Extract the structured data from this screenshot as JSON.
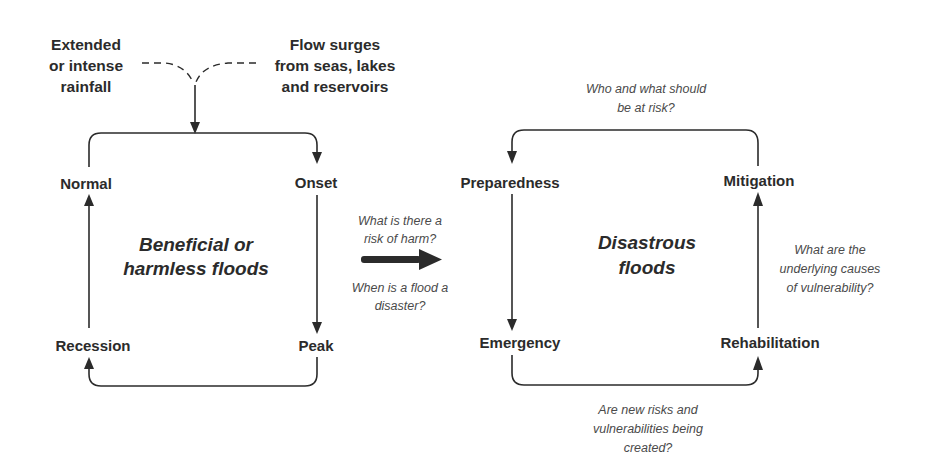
{
  "diagram": {
    "inputs": {
      "rainfall": [
        "Extended",
        "or intense",
        "rainfall"
      ],
      "surges": [
        "Flow surges",
        "from seas, lakes",
        "and reservoirs"
      ]
    },
    "left_cycle": {
      "title": [
        "Beneficial or",
        "harmless floods"
      ],
      "nodes": {
        "normal": "Normal",
        "onset": "Onset",
        "peak": "Peak",
        "recession": "Recession"
      }
    },
    "transition": {
      "question_above": [
        "What is there a",
        "risk of harm?"
      ],
      "question_below": [
        "When is a flood a",
        "disaster?"
      ]
    },
    "right_cycle": {
      "title": [
        "Disastrous",
        "floods"
      ],
      "nodes": {
        "preparedness": "Preparedness",
        "mitigation": "Mitigation",
        "emergency": "Emergency",
        "rehabilitation": "Rehabilitation"
      },
      "questions": {
        "top": [
          "Who and what should",
          "be at risk?"
        ],
        "right": [
          "What are the",
          "underlying causes",
          "of vulnerability?"
        ],
        "bottom": [
          "Are new risks and",
          "vulnerabilities being",
          "created?"
        ]
      }
    },
    "colors": {
      "ink": "#2b2b2b",
      "question_text": "#4a4a4a",
      "background": "#ffffff"
    }
  }
}
